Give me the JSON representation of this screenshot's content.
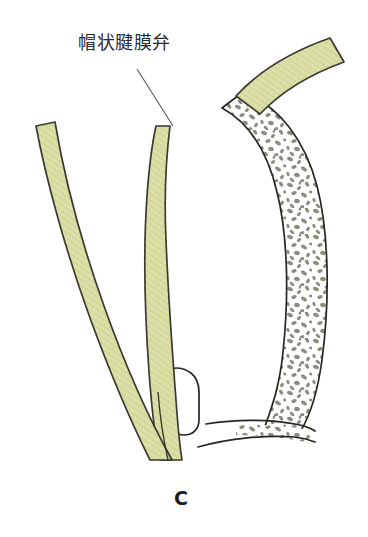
{
  "figure": {
    "panel_letter": "C",
    "callout_label": "帽状腱膜弁",
    "caption_partial": "",
    "background_color": "#ffffff"
  },
  "palette": {
    "flap_fill": "#dcdfa8",
    "flap_stroke": "#3a3a30",
    "bone_outline": "#262622",
    "trabecula_fill": "#8d8d7c",
    "diploe_background": "#ffffff",
    "text_color": "#2b2b2b",
    "leader_line_color": "#5a5a5a"
  },
  "structures": [
    {
      "name": "galeal-flap-left-limb",
      "type": "soft-tissue-band",
      "fill": "#dcdfa8"
    },
    {
      "name": "galeal-flap-pedicle",
      "type": "soft-tissue-band",
      "fill": "#dcdfa8"
    },
    {
      "name": "pericranial-band-superior",
      "type": "soft-tissue-band",
      "fill": "#dcdfa8"
    },
    {
      "name": "cranial-bone-vault",
      "type": "bone",
      "fill": "#ffffff",
      "stroke": "#262622"
    },
    {
      "name": "cranial-bone-base",
      "type": "bone",
      "fill": "#ffffff",
      "stroke": "#262622"
    },
    {
      "name": "sinus-cavity",
      "type": "cavity",
      "fill": "#ffffff"
    }
  ],
  "annotations": {
    "leader_line": {
      "name": "callout-leader-line",
      "from_x": 137,
      "from_y": 69,
      "to_x": 173,
      "to_y": 126
    }
  }
}
